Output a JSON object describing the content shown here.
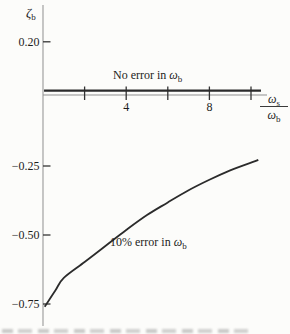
{
  "figure": {
    "y_axis_title": {
      "symbol": "ζ",
      "subscript": "b"
    },
    "x_axis_title": {
      "numerator": {
        "symbol": "ω",
        "subscript": "s"
      },
      "denominator": {
        "symbol": "ω",
        "subscript": "b"
      }
    },
    "annotations": {
      "no_error": {
        "text": "No error in ",
        "symbol": "ω",
        "subscript": "b"
      },
      "ten_pct": {
        "text": "10% error in ",
        "symbol": "ω",
        "subscript": "b"
      }
    },
    "colors": {
      "curve": "#2b2b2b",
      "axis": "#8f8f8f",
      "tick": "#333333",
      "text": "#1c1c1c",
      "background": "#fcfcfa"
    }
  },
  "chart_data": {
    "type": "line",
    "title": "",
    "xlabel": "ω_s / ω_b",
    "ylabel": "ζ_b",
    "xlim": [
      0,
      10.8
    ],
    "ylim": [
      -0.85,
      0.28
    ],
    "grid": false,
    "legend_position": "inline-annotations",
    "x_ticks": [
      {
        "value": 2,
        "label": ""
      },
      {
        "value": 4,
        "label": "4"
      },
      {
        "value": 6,
        "label": ""
      },
      {
        "value": 8,
        "label": "8"
      },
      {
        "value": 10,
        "label": ""
      }
    ],
    "y_ticks": [
      {
        "value": 0.2,
        "label": "0.20"
      },
      {
        "value": -0.25,
        "label": "−0.25"
      },
      {
        "value": -0.5,
        "label": "−0.50"
      },
      {
        "value": -0.75,
        "label": "−0.75"
      }
    ],
    "series": [
      {
        "name": "No error in ωb",
        "style": "flat-thick",
        "points": [
          [
            0.05,
            0.023
          ],
          [
            10.48,
            0.023
          ]
        ]
      },
      {
        "name": "10% error in ωb",
        "style": "curve",
        "points": [
          [
            0.08,
            -0.76
          ],
          [
            0.6,
            -0.7
          ],
          [
            1.0,
            -0.655
          ],
          [
            2.0,
            -0.598
          ],
          [
            3.0,
            -0.54
          ],
          [
            4.0,
            -0.482
          ],
          [
            5.0,
            -0.428
          ],
          [
            6.0,
            -0.382
          ],
          [
            7.0,
            -0.338
          ],
          [
            8.0,
            -0.3
          ],
          [
            9.0,
            -0.266
          ],
          [
            10.0,
            -0.238
          ],
          [
            10.35,
            -0.228
          ]
        ]
      }
    ]
  }
}
